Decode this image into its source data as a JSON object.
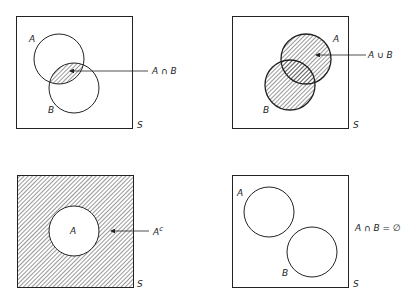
{
  "panels": [
    {
      "name": "intersection",
      "set_a_label": "A",
      "set_b_label": "B",
      "universe_label": "S",
      "annotation": "A ∩ B"
    },
    {
      "name": "union",
      "set_a_label": "A",
      "set_b_label": "B",
      "universe_label": "S",
      "annotation": "A ∪ B"
    },
    {
      "name": "complement",
      "set_a_label": "A",
      "universe_label": "S",
      "annotation_base": "A",
      "annotation_sup": "c"
    },
    {
      "name": "disjoint",
      "set_a_label": "A",
      "set_b_label": "B",
      "universe_label": "S",
      "annotation": "A ∩ B = ∅"
    }
  ],
  "colors": {
    "stroke": "#222222",
    "hatch": "#333333",
    "background": "#ffffff"
  }
}
